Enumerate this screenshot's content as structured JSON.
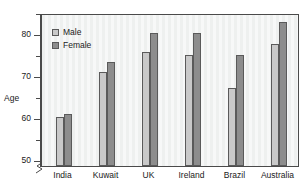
{
  "chart_data": {
    "type": "bar",
    "title": "",
    "xlabel": "",
    "ylabel": "Age",
    "categories": [
      "India",
      "Kuwait",
      "UK",
      "Ireland",
      "Brazil",
      "Australia"
    ],
    "series": [
      {
        "name": "Male",
        "color": "#c9c9c9",
        "values": [
          60.2,
          71.0,
          75.6,
          75.1,
          67.1,
          77.6
        ]
      },
      {
        "name": "Female",
        "color": "#8d8d8d",
        "values": [
          60.9,
          73.3,
          80.3,
          80.3,
          74.9,
          82.9
        ]
      }
    ],
    "ylim": [
      48.5,
      85.0
    ],
    "ytick_labels": [
      "50",
      "60",
      "70",
      "80"
    ],
    "ytick_values": [
      50,
      60,
      70,
      80
    ],
    "yminor_values": [
      55,
      65,
      75,
      85
    ],
    "axis_break": true,
    "grid": false,
    "legend_position": "top-left",
    "plot_background": "#eef0ef",
    "frame_color": "#4a4a4a"
  },
  "legend": {
    "items": [
      {
        "label": "Male"
      },
      {
        "label": "Female"
      }
    ]
  },
  "axes": {
    "y_title": "Age"
  }
}
